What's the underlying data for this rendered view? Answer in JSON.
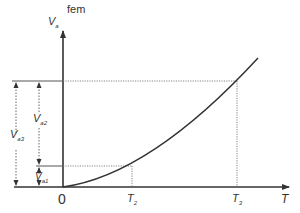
{
  "diagram": {
    "y_axis": {
      "title": "fem",
      "symbol": "V",
      "symbol_sub": "a"
    },
    "x_axis": {
      "symbol": "T",
      "origin": "0"
    },
    "ticks": [
      {
        "symbol": "T",
        "sub": "2"
      },
      {
        "symbol": "T",
        "sub": "3"
      }
    ],
    "dimensions": [
      {
        "symbol": "V",
        "sub": "a3"
      },
      {
        "symbol": "V",
        "sub": "a2"
      },
      {
        "symbol": "V",
        "sub": "a1"
      }
    ],
    "colors": {
      "axis": "#333333",
      "curve": "#333333",
      "dotted": "#777777"
    }
  }
}
